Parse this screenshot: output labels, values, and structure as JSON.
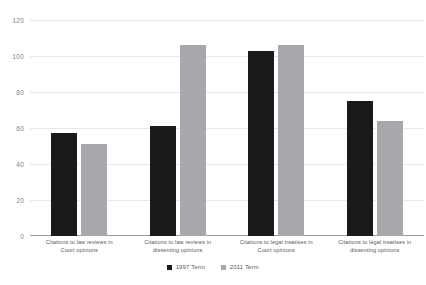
{
  "chart_data": {
    "type": "bar",
    "title": "",
    "subtitle": "",
    "xlabel": "",
    "ylabel": "",
    "ylim": [
      0,
      120
    ],
    "yticks": [
      0,
      20,
      40,
      60,
      80,
      100,
      120
    ],
    "ytick_labels": [
      "0",
      "20",
      "40",
      "60",
      "80",
      "100",
      "120"
    ],
    "grid": true,
    "legend_position": "bottom",
    "categories": [
      "Citations to law reviews in Court opinions",
      "Citations to law reviews in dissenting opinions",
      "Citations to legal treatises in Court opinions",
      "Citations to legal treatises in dissenting opinions"
    ],
    "category_lines": [
      [
        "Citations to law reviews in",
        "Court opinions"
      ],
      [
        "Citations to law reviews in",
        "dissenting opinions"
      ],
      [
        "Citations to legal treatises in",
        "Court opinions"
      ],
      [
        "Citations to legal treatises in",
        "dissenting opinions"
      ]
    ],
    "series": [
      {
        "name": "1997 Term",
        "color": "#1a1a1a",
        "values": [
          57,
          61,
          103,
          75
        ]
      },
      {
        "name": "2011 Term",
        "color": "#a6a8ab",
        "values": [
          51,
          106,
          106,
          64
        ]
      }
    ]
  },
  "colors": {
    "series_1997": "#1a1a1a",
    "series_2011": "#a6a8ab",
    "gridline": "#e8e8e8",
    "axis": "#9a9a9a",
    "text": "#58595b",
    "background": "#ffffff"
  }
}
